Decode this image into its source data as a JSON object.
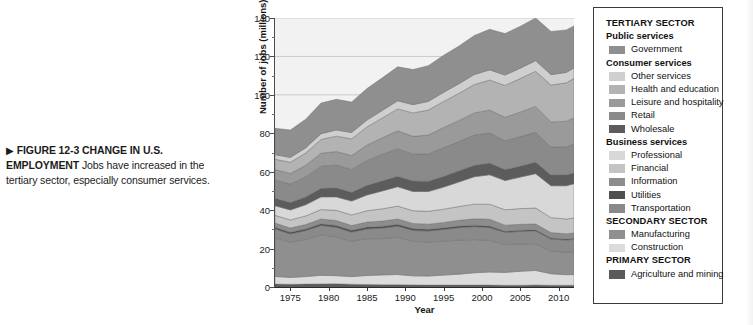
{
  "caption": {
    "arrow": "▶",
    "lead": "FIGURE 12-3  CHANGE IN U.S. EMPLOYMENT",
    "body": "  Jobs have increased in the tertiary sector, especially consumer services."
  },
  "legend": {
    "sections": [
      {
        "sector": "TERTIARY SECTOR",
        "groups": [
          {
            "group": "Public services",
            "items": [
              {
                "label": "Government",
                "color": "#8f8f8f"
              }
            ]
          },
          {
            "group": "Consumer services",
            "items": [
              {
                "label": "Other services",
                "color": "#cfcfcf"
              },
              {
                "label": "Health and education",
                "color": "#b3b3b3"
              },
              {
                "label": "Leisure and hospitality",
                "color": "#9a9a9a"
              },
              {
                "label": "Retail",
                "color": "#8a8a8a"
              },
              {
                "label": "Wholesale",
                "color": "#5c5c5c"
              }
            ]
          },
          {
            "group": "Business services",
            "items": [
              {
                "label": "Professional",
                "color": "#d8d8d8"
              },
              {
                "label": "Financial",
                "color": "#c4c4c4"
              },
              {
                "label": "Information",
                "color": "#8d8d8d"
              },
              {
                "label": "Utilities",
                "color": "#4f4f4f"
              },
              {
                "label": "Transportation",
                "color": "#8a8a8a"
              }
            ]
          }
        ]
      },
      {
        "sector": "SECONDARY SECTOR",
        "groups": [
          {
            "group": null,
            "items": [
              {
                "label": "Manufacturing",
                "color": "#8f8f8f"
              },
              {
                "label": "Construction",
                "color": "#dcdcdc"
              }
            ]
          }
        ]
      },
      {
        "sector": "PRIMARY SECTOR",
        "groups": [
          {
            "group": null,
            "items": [
              {
                "label": "Agriculture and mining",
                "color": "#5a5a5a"
              }
            ]
          }
        ]
      }
    ]
  },
  "chart_data": {
    "type": "area",
    "title": "",
    "xlabel": "Year",
    "ylabel": "Number of jobs (millions)",
    "xlim": [
      1973,
      2012
    ],
    "ylim": [
      0,
      140
    ],
    "ytick_step": 20,
    "yminor_step": 10,
    "xtick_step": 5,
    "grid": true,
    "grid_color": "#b9b9b9",
    "plot_background": "#f2f2f2",
    "stacked": true,
    "legend_position": "right",
    "xticks": [
      1975,
      1980,
      1985,
      1990,
      1995,
      2000,
      2005,
      2010
    ],
    "yticks": [
      0,
      20,
      40,
      60,
      80,
      100,
      120,
      140
    ],
    "x": [
      1973,
      1975,
      1977,
      1979,
      1981,
      1983,
      1985,
      1987,
      1989,
      1991,
      1993,
      1995,
      1997,
      1999,
      2001,
      2003,
      2005,
      2007,
      2009,
      2011,
      2012
    ],
    "series": [
      {
        "name": "Agriculture and mining",
        "color": "#5a5a5a",
        "values": [
          1.5,
          1.4,
          1.5,
          1.6,
          1.7,
          1.4,
          1.3,
          1.2,
          1.2,
          1.1,
          1.0,
          1.0,
          1.0,
          1.0,
          1.0,
          0.9,
          0.9,
          1.0,
          0.9,
          0.9,
          0.9
        ]
      },
      {
        "name": "Construction",
        "color": "#dcdcdc",
        "values": [
          4.0,
          3.6,
          3.9,
          4.5,
          4.2,
          4.0,
          4.7,
          5.1,
          5.3,
          4.7,
          4.7,
          5.2,
          5.7,
          6.4,
          6.8,
          6.7,
          7.3,
          7.6,
          6.0,
          5.5,
          5.6
        ]
      },
      {
        "name": "Manufacturing",
        "color": "#8f8f8f",
        "values": [
          20.2,
          18.3,
          19.4,
          21.0,
          20.2,
          18.4,
          19.2,
          18.9,
          19.4,
          18.0,
          17.7,
          17.6,
          17.7,
          17.3,
          16.4,
          14.5,
          14.2,
          13.9,
          11.8,
          11.7,
          11.9
        ]
      },
      {
        "name": "Transportation",
        "color": "#8a8a8a",
        "values": [
          4.5,
          4.3,
          4.5,
          4.9,
          4.9,
          4.7,
          5.0,
          5.4,
          5.7,
          5.6,
          5.7,
          6.1,
          6.4,
          6.7,
          6.7,
          6.3,
          6.5,
          6.7,
          6.2,
          6.3,
          6.4
        ]
      },
      {
        "name": "Utilities",
        "color": "#4f4f4f",
        "values": [
          0.9,
          0.9,
          0.9,
          0.9,
          1.0,
          1.0,
          1.0,
          1.0,
          1.0,
          1.0,
          0.9,
          0.9,
          0.9,
          0.8,
          0.8,
          0.6,
          0.6,
          0.6,
          0.6,
          0.6,
          0.6
        ]
      },
      {
        "name": "Information",
        "color": "#8d8d8d",
        "values": [
          2.2,
          2.2,
          2.3,
          2.5,
          2.6,
          2.5,
          2.6,
          2.7,
          2.8,
          2.7,
          2.7,
          2.8,
          3.0,
          3.3,
          3.6,
          3.2,
          3.1,
          3.0,
          2.8,
          2.7,
          2.7
        ]
      },
      {
        "name": "Financial",
        "color": "#c4c4c4",
        "values": [
          4.0,
          4.2,
          4.5,
          4.9,
          5.3,
          5.5,
          5.9,
          6.4,
          6.7,
          6.6,
          6.7,
          6.9,
          7.2,
          7.6,
          7.8,
          8.0,
          8.2,
          8.3,
          7.8,
          7.7,
          7.8
        ]
      },
      {
        "name": "Professional",
        "color": "#d8d8d8",
        "values": [
          5.0,
          5.2,
          5.8,
          6.6,
          7.0,
          7.2,
          8.2,
          9.3,
          10.1,
          10.0,
          10.3,
          11.5,
          12.8,
          14.3,
          15.3,
          15.2,
          16.4,
          17.9,
          16.6,
          17.3,
          17.9
        ]
      },
      {
        "name": "Wholesale",
        "color": "#5c5c5c",
        "values": [
          3.9,
          3.9,
          4.1,
          4.5,
          4.7,
          4.6,
          5.0,
          5.3,
          5.5,
          5.5,
          5.4,
          5.6,
          5.8,
          6.0,
          6.1,
          5.7,
          5.8,
          6.0,
          5.6,
          5.6,
          5.7
        ]
      },
      {
        "name": "Retail",
        "color": "#8a8a8a",
        "values": [
          9.5,
          9.6,
          10.4,
          11.5,
          11.9,
          11.9,
          13.0,
          13.8,
          14.3,
          13.9,
          14.2,
          14.9,
          15.2,
          15.7,
          15.6,
          15.0,
          15.3,
          15.5,
          14.5,
          14.6,
          14.9
        ]
      },
      {
        "name": "Leisure and hospitality",
        "color": "#9a9a9a",
        "values": [
          5.4,
          5.5,
          6.0,
          6.7,
          7.0,
          7.2,
          8.0,
          8.6,
          9.3,
          9.3,
          9.8,
          10.5,
          11.0,
          11.5,
          12.0,
          12.2,
          12.8,
          13.5,
          13.1,
          13.4,
          13.7
        ]
      },
      {
        "name": "Health and education",
        "color": "#b3b3b3",
        "values": [
          5.4,
          5.8,
          6.4,
          7.2,
          8.0,
          8.7,
          9.4,
          10.3,
          11.4,
          12.2,
          13.0,
          13.6,
          14.1,
          14.8,
          15.6,
          16.6,
          17.4,
          18.3,
          19.2,
          20.0,
          20.5
        ]
      },
      {
        "name": "Other services",
        "color": "#cfcfcf",
        "values": [
          2.4,
          2.5,
          2.7,
          3.0,
          3.2,
          3.3,
          3.6,
          3.9,
          4.2,
          4.3,
          4.5,
          4.7,
          5.0,
          5.2,
          5.3,
          5.4,
          5.4,
          5.5,
          5.4,
          5.4,
          5.4
        ]
      },
      {
        "name": "Government",
        "color": "#8f8f8f",
        "values": [
          13.7,
          14.3,
          14.9,
          15.9,
          16.0,
          15.9,
          16.4,
          17.0,
          17.7,
          18.3,
          18.6,
          19.3,
          19.6,
          20.3,
          21.1,
          21.6,
          21.8,
          22.2,
          22.5,
          22.1,
          21.9
        ]
      }
    ]
  }
}
